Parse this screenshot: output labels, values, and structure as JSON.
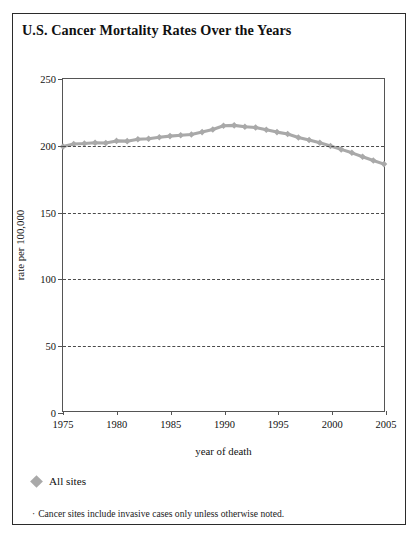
{
  "figure": {
    "title": "U.S. Cancer Mortality Rates Over the Years",
    "legend_label": "All sites",
    "footnote_bullet": "·",
    "footnote_text": "Cancer sites include invasive cases only unless otherwise noted.",
    "series_color": "#a9a9a9",
    "frame_color": "#2b2b2b",
    "axis_color": "#555555",
    "grid_color": "#4a4a4a"
  },
  "chart_data": {
    "type": "line",
    "title": "U.S. Cancer Mortality Rates Over the Years",
    "xlabel": "year of death",
    "ylabel": "rate per 100,000",
    "xlim": [
      1975,
      2005
    ],
    "ylim": [
      0,
      250
    ],
    "xticks": [
      1975,
      1980,
      1985,
      1990,
      1995,
      2000,
      2005
    ],
    "xtick_labels": [
      "1975",
      "1980",
      "1985",
      "1990",
      "1995",
      "2000",
      "2005"
    ],
    "yticks": [
      0,
      50,
      100,
      150,
      200,
      250
    ],
    "ytick_labels": [
      "0",
      "50",
      "100",
      "150",
      "200",
      "250"
    ],
    "grid": "horizontal-dashed",
    "legend_position": "below-plot-left",
    "marker": "diamond",
    "series": [
      {
        "name": "All sites",
        "color": "#a9a9a9",
        "x": [
          1975,
          1976,
          1977,
          1978,
          1979,
          1980,
          1981,
          1982,
          1983,
          1984,
          1985,
          1986,
          1987,
          1988,
          1989,
          1990,
          1991,
          1992,
          1993,
          1994,
          1995,
          1996,
          1997,
          1998,
          1999,
          2000,
          2001,
          2002,
          2003,
          2004,
          2005
        ],
        "values": [
          199.1,
          201.0,
          201.4,
          202.0,
          201.8,
          203.4,
          203.2,
          204.6,
          205.0,
          206.2,
          207.0,
          207.6,
          208.2,
          210.0,
          212.0,
          214.8,
          215.1,
          214.0,
          213.5,
          211.8,
          210.0,
          208.6,
          206.0,
          204.0,
          202.0,
          199.6,
          197.0,
          194.4,
          191.5,
          188.6,
          185.9
        ]
      }
    ]
  }
}
